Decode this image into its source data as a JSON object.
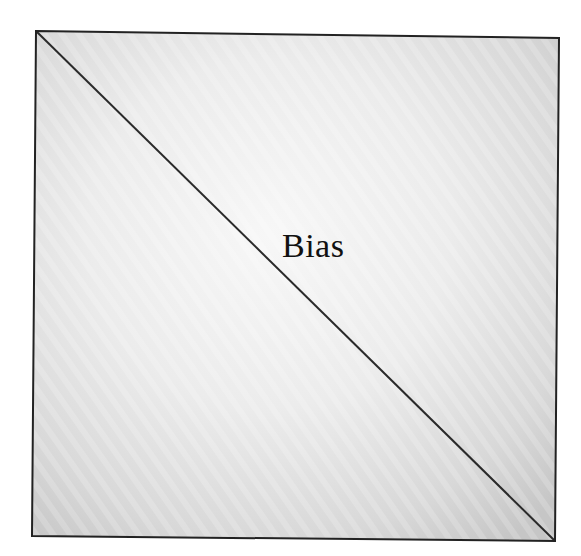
{
  "diagram": {
    "label": "Bias",
    "shape": "square-with-diagonal",
    "colors": {
      "border": "#222222",
      "diagonal": "#2a2a2a",
      "fill_light": "#f4f4f4",
      "fill_dark": "#c9c9c9",
      "text": "#111111"
    }
  }
}
